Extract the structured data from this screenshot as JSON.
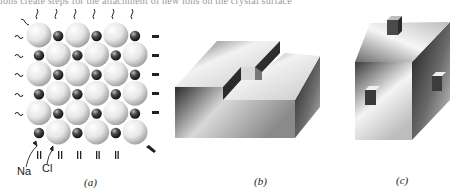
{
  "caption_fragment": "ions create steps for the attachment of new ions on the crystal surface",
  "panels": [
    {
      "id": "a",
      "label": "(a)",
      "description": "NaCl crystal surface lattice of alternating large Cl ions and small Na ions"
    },
    {
      "id": "b",
      "label": "(b)",
      "description": "Block with a surface step and a kink site"
    },
    {
      "id": "c",
      "label": "(c)",
      "description": "Cube with single adatoms on top and side faces"
    }
  ],
  "atom_labels": {
    "sodium": "Na",
    "chlorine": "Cl"
  },
  "lattice": {
    "rows": 6,
    "cols": 6,
    "large_ion": "Cl",
    "small_ion": "Na",
    "first_row_starts_with": "Cl"
  },
  "colors": {
    "cl_light": "#f4f4f4",
    "cl_shade": "#9a9a9a",
    "na_light": "#9a9a9a",
    "na_dark": "#1a1a1a",
    "text": "#222222"
  }
}
